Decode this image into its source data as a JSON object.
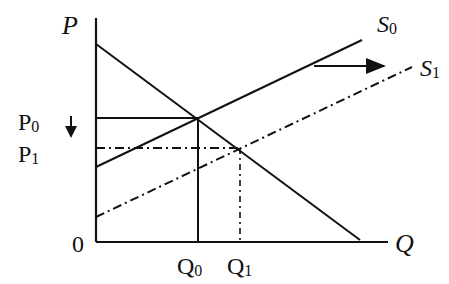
{
  "diagram": {
    "type": "supply-demand",
    "axes": {
      "y_label": "P",
      "x_label": "Q",
      "origin_label": "0"
    },
    "price_labels": [
      {
        "main": "P",
        "sub": "0"
      },
      {
        "main": "P",
        "sub": "1"
      }
    ],
    "quantity_labels": [
      {
        "main": "Q",
        "sub": "0"
      },
      {
        "main": "Q",
        "sub": "1"
      }
    ],
    "curves": {
      "supply_original": {
        "main": "S",
        "sub": "0",
        "style": "solid"
      },
      "supply_shifted": {
        "main": "S",
        "sub": "1",
        "style": "dash-dot"
      },
      "demand": {
        "style": "solid"
      }
    },
    "annotations": {
      "shift_arrow": "right",
      "price_change_arrow": "down"
    },
    "colors": {
      "line": "#111111",
      "background": "#ffffff"
    }
  }
}
